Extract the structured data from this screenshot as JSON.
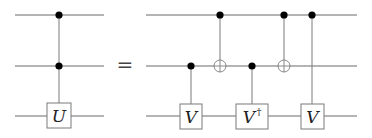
{
  "diagram": {
    "type": "quantum-circuit-identity",
    "equals_sign": "=",
    "colors": {
      "wire": "#6a6a6a",
      "control": "#000000",
      "box_border": "#7a7a7a",
      "text": "#222222"
    },
    "left_circuit": {
      "qubits": 3,
      "gates": [
        {
          "type": "controlled-U",
          "controls": [
            0,
            1
          ],
          "target": 2,
          "label": "U"
        }
      ]
    },
    "right_circuit": {
      "qubits": 3,
      "gates": [
        {
          "type": "controlled",
          "control": 1,
          "target": 2,
          "label": "V",
          "sup": ""
        },
        {
          "type": "CNOT",
          "control": 0,
          "target": 1
        },
        {
          "type": "controlled",
          "control": 1,
          "target": 2,
          "label": "V",
          "sup": "†"
        },
        {
          "type": "CNOT",
          "control": 0,
          "target": 1
        },
        {
          "type": "controlled",
          "control": 0,
          "target": 2,
          "label": "V",
          "sup": ""
        }
      ]
    }
  }
}
